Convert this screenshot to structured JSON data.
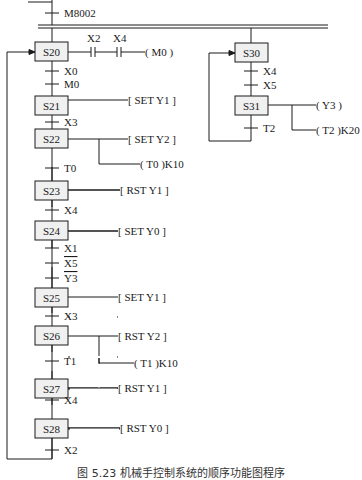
{
  "init_transition": {
    "label": "M8002"
  },
  "left_branch": {
    "steps": [
      {
        "id": "S20",
        "actions": [
          {
            "text": "( M0 )",
            "kind": "coil",
            "contacts": [
              "X2",
              "X4"
            ]
          }
        ]
      },
      {
        "id": "S21",
        "actions": [
          {
            "text": "[ SET  Y1 ]"
          }
        ]
      },
      {
        "id": "S22",
        "actions": [
          {
            "text": "[ SET  Y2 ]"
          },
          {
            "text": "( T0 )K10"
          }
        ]
      },
      {
        "id": "S23",
        "actions": [
          {
            "text": "[ RST  Y1 ]"
          }
        ]
      },
      {
        "id": "S24",
        "actions": [
          {
            "text": "[ SET  Y0 ]"
          }
        ]
      },
      {
        "id": "S25",
        "actions": [
          {
            "text": "[ SET  Y1 ]"
          }
        ]
      },
      {
        "id": "S26",
        "actions": [
          {
            "text": "[ RST  Y2 ]"
          },
          {
            "text": "( T1 )K10"
          }
        ]
      },
      {
        "id": "S27",
        "actions": [
          {
            "text": "[ RST  Y1 ]"
          }
        ]
      },
      {
        "id": "S28",
        "actions": [
          {
            "text": "[ RST  Y0 ]"
          }
        ]
      }
    ],
    "transitions": [
      {
        "after": "S20",
        "labels": [
          "X0",
          "M0"
        ]
      },
      {
        "after": "S21",
        "labels": [
          "X3"
        ]
      },
      {
        "after": "S22",
        "labels": [
          "T0"
        ]
      },
      {
        "after": "S23",
        "labels": [
          "X4"
        ]
      },
      {
        "after": "S24",
        "labels": [
          "X1",
          "X5",
          "Y3"
        ],
        "negated": [
          "X5",
          "Y3"
        ]
      },
      {
        "after": "S25",
        "labels": [
          "X3"
        ]
      },
      {
        "after": "S26",
        "labels": [
          "T1"
        ]
      },
      {
        "after": "S27",
        "labels": [
          "X4"
        ]
      },
      {
        "after": "S28",
        "labels": [
          "X2"
        ],
        "jump_to": "S20"
      }
    ]
  },
  "right_branch": {
    "steps": [
      {
        "id": "S30",
        "actions": []
      },
      {
        "id": "S31",
        "actions": [
          {
            "text": "( Y3 )"
          },
          {
            "text": "( T2 )K20"
          }
        ]
      }
    ],
    "transitions": [
      {
        "after": "S30",
        "labels": [
          "X4",
          "X5"
        ]
      },
      {
        "after": "S31",
        "labels": [
          "T2"
        ],
        "jump_to": "S30"
      }
    ]
  },
  "caption": "图 5.23   机械手控制系统的顺序功能图程序",
  "colors": {
    "line": "#1a1a1a",
    "step_fill": "#f0f0f0",
    "background": "#ffffff"
  }
}
